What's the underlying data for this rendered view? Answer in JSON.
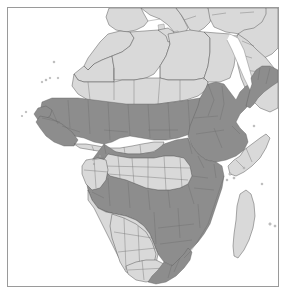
{
  "figure": {
    "type": "distribution-map",
    "title": "",
    "caption": "",
    "region_description": "Africa, Mediterranean basin and Arabian Peninsula",
    "projection_note": ""
  },
  "frame": {
    "border_color": "#9a9a9a",
    "background_color": "#ffffff"
  },
  "legend": {
    "present": false,
    "entries": [
      {
        "key": "range",
        "label": "",
        "color": "#8d8d8d"
      },
      {
        "key": "land",
        "label": "",
        "color": "#d9d9d9"
      },
      {
        "key": "ocean",
        "label": "",
        "color": "#ffffff"
      }
    ]
  },
  "colors": {
    "range_fill": "#8d8d8d",
    "land_fill": "#d9d9d9",
    "ocean_fill": "#ffffff",
    "border_stroke": "#5a5a5a",
    "coast_stroke": "#4a4a4a",
    "frame_stroke": "#9a9a9a"
  },
  "map_content": {
    "shaded_areas": [
      "West African Sahel and Guinea belt",
      "Senegal and Gambia",
      "Guinea, Sierra Leone, Liberia, Ivory Coast interior",
      "Southern Mali, Burkina Faso, northern Ghana, Togo, Benin",
      "Nigeria and Niger south",
      "Chad south and Cameroon north",
      "Sudan and South Sudan",
      "Eritrea, Ethiopia, Djibouti",
      "Uganda, Kenya, Rwanda, Burundi, Tanzania",
      "Democratic Republic of the Congo periphery",
      "Angola, Zambia, Malawi, Mozambique",
      "Zimbabwe and eastern South Africa",
      "Southwestern and southern Arabian coast (Yemen and Oman)"
    ],
    "unshaded_areas": [
      "Morocco, Algeria, Tunisia, Libya, Egypt (Sahara and Mediterranean coast)",
      "Mauritania and northern Mali, Niger, Chad",
      "Congo Basin interior, Gabon, Republic of the Congo",
      "Somalia",
      "Namibia, Botswana and interior South Africa",
      "Madagascar",
      "Southern Europe, Turkey and the Levant",
      "Arabian Peninsula interior"
    ],
    "labels": []
  }
}
